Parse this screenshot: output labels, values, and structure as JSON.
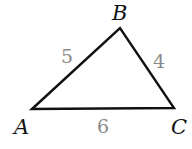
{
  "diagram": {
    "type": "triangle",
    "vertices": [
      {
        "name": "A",
        "x": 32,
        "y": 109,
        "label_x": 14,
        "label_y": 134
      },
      {
        "name": "B",
        "x": 120,
        "y": 28,
        "label_x": 112,
        "label_y": 20
      },
      {
        "name": "C",
        "x": 174,
        "y": 108,
        "label_x": 171,
        "label_y": 134
      }
    ],
    "sides": [
      {
        "between": "AB",
        "length": "5",
        "label_x": 61,
        "label_y": 63
      },
      {
        "between": "BC",
        "length": "4",
        "label_x": 153,
        "label_y": 68
      },
      {
        "between": "AC",
        "length": "6",
        "label_x": 97,
        "label_y": 133
      }
    ],
    "colors": {
      "stroke": "#111111",
      "side_label": "#8a8a8a",
      "vertex_label": "#111111",
      "background": "#ffffff"
    }
  }
}
